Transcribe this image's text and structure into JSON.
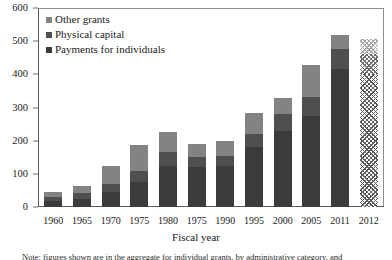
{
  "chart_data": {
    "type": "bar",
    "stacked": true,
    "title": "",
    "xlabel": "Fiscal year",
    "ylabel": "",
    "ylim": [
      0,
      600
    ],
    "yticks": [
      0,
      100,
      200,
      300,
      400,
      500,
      600
    ],
    "grid": false,
    "legend_position": "top-left",
    "categories": [
      "1960",
      "1965",
      "1970",
      "1975",
      "1980",
      "1975",
      "1990",
      "1995",
      "2000",
      "2005",
      "2011",
      "2012"
    ],
    "series": [
      {
        "name": "Payments for individuals",
        "color": "#3b3b3b",
        "values": [
          17,
          25,
          45,
          75,
          125,
          122,
          125,
          180,
          230,
          275,
          415,
          400
        ]
      },
      {
        "name": "Physical capital",
        "color": "#4f4f4f",
        "values": [
          14,
          17,
          25,
          35,
          42,
          30,
          30,
          40,
          50,
          58,
          62,
          60
        ]
      },
      {
        "name": "Other grants",
        "color": "#838383",
        "values": [
          14,
          21,
          55,
          78,
          60,
          38,
          43,
          65,
          50,
          95,
          41,
          48
        ]
      }
    ],
    "totals": [
      45,
      63,
      125,
      188,
      227,
      190,
      198,
      285,
      330,
      428,
      518,
      508
    ],
    "projected_categories": [
      "2012"
    ],
    "annotations": []
  },
  "legend": {
    "items": [
      {
        "label": "Other grants",
        "swatch": "#838383"
      },
      {
        "label": "Physical capital",
        "swatch": "#4f4f4f"
      },
      {
        "label": "Payments for individuals",
        "swatch": "#3b3b3b"
      }
    ]
  },
  "axis": {
    "x_title": "Fiscal year"
  },
  "footnote": {
    "text": "Note: figures shown are in the aggregate for individual grants, by administrative category, and"
  }
}
